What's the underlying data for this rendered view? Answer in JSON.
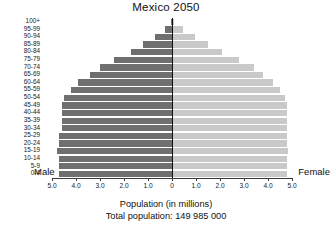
{
  "chart_data": {
    "type": "bar",
    "title": "Mexico 2050",
    "subtitle": "",
    "xlabel": "Population (in millions)",
    "ylabel": "",
    "annotations": [
      "Total population: 149 985 000"
    ],
    "orientation": "population-pyramid",
    "grid": false,
    "legend_position": "inline-axis-ends",
    "xlim": [
      -5.0,
      5.0
    ],
    "xtick_labels": [
      "5.0",
      "4.0",
      "3.0",
      "2.0",
      "1.0",
      "0",
      "1.0",
      "2.0",
      "3.0",
      "4.0",
      "5.0"
    ],
    "xtick_values": [
      -5.0,
      -4.0,
      -3.0,
      -2.0,
      -1.0,
      0,
      1.0,
      2.0,
      3.0,
      4.0,
      5.0
    ],
    "categories": [
      "100+",
      "95-99",
      "90-94",
      "85-89",
      "80-84",
      "75-79",
      "70-74",
      "65-69",
      "60-64",
      "55-59",
      "50-54",
      "45-49",
      "40-44",
      "35-39",
      "30-34",
      "25-29",
      "20-24",
      "15-19",
      "10-14",
      "5-9",
      "0-4"
    ],
    "series": [
      {
        "name": "Male",
        "color": "#706f6f",
        "side": "left",
        "values": [
          0.05,
          0.3,
          0.7,
          1.2,
          1.7,
          2.4,
          3.0,
          3.4,
          3.9,
          4.2,
          4.5,
          4.6,
          4.6,
          4.6,
          4.6,
          4.7,
          4.7,
          4.8,
          4.7,
          4.7,
          4.7
        ]
      },
      {
        "name": "Female",
        "color": "#c9c9c9",
        "side": "right",
        "values": [
          0.1,
          0.45,
          0.95,
          1.5,
          2.1,
          2.8,
          3.4,
          3.8,
          4.2,
          4.5,
          4.7,
          4.8,
          4.8,
          4.8,
          4.8,
          4.8,
          4.8,
          4.85,
          4.8,
          4.8,
          4.8
        ]
      }
    ]
  },
  "labels": {
    "male": "Male",
    "female": "Female",
    "xaxis_caption": "Population (in millions)",
    "total_population": "Total population: 149 985 000"
  }
}
